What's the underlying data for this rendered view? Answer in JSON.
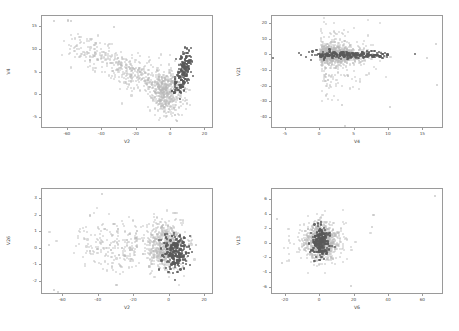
{
  "figure": {
    "title": "",
    "background": "#ffffff",
    "layout": "2x2 scatter plot grid",
    "colors": {
      "majority_class": "#b9b9b9",
      "minority_class": "#595959",
      "axis": "#9a9a9a",
      "text": "#4a4a4a"
    }
  },
  "chart_data": [
    {
      "type": "scatter",
      "panel": "top-left",
      "title": "",
      "xlabel": "V2",
      "ylabel": "V4",
      "xlim": [
        -75,
        25
      ],
      "ylim": [
        -7.5,
        17.5
      ],
      "xticks": [
        "-60",
        "-40",
        "-20",
        "0",
        "20"
      ],
      "xtick_values": [
        -60,
        -40,
        -20,
        0,
        20
      ],
      "yticks": [
        "-5",
        "0",
        "5",
        "10",
        "15"
      ],
      "ytick_values": [
        -5,
        0,
        5,
        10,
        15
      ],
      "grid": false,
      "legend": "none",
      "series": [
        {
          "name": "majority",
          "color": "#b9b9b9",
          "n_points": 900,
          "center": [
            -4,
            2.0
          ],
          "spread": [
            9.0,
            3.2
          ],
          "description": "broad light-gray wedge fanning up-left from origin toward (-50, 11)"
        },
        {
          "name": "minority",
          "color": "#595959",
          "n_points": 170,
          "center": [
            4.5,
            5.0
          ],
          "spread": [
            3.5,
            2.6
          ],
          "description": "dark compact cluster at positive V2, V4 between 0 and 12"
        }
      ]
    },
    {
      "type": "scatter",
      "panel": "top-right",
      "title": "",
      "xlabel": "V4",
      "ylabel": "V21",
      "xlim": [
        -7,
        18
      ],
      "ylim": [
        -47,
        25
      ],
      "xticks": [
        "-5",
        "0",
        "5",
        "10",
        "15"
      ],
      "xtick_values": [
        -5,
        0,
        5,
        10,
        15
      ],
      "yticks": [
        "-40",
        "-30",
        "-20",
        "-10",
        "0",
        "10",
        "20"
      ],
      "ytick_values": [
        -40,
        -30,
        -20,
        -10,
        0,
        10,
        20
      ],
      "grid": false,
      "legend": "none",
      "series": [
        {
          "name": "majority",
          "color": "#b9b9b9",
          "n_points": 950,
          "center": [
            3.0,
            0.0
          ],
          "spread": [
            3.2,
            6.0
          ],
          "description": "light-gray horizontal band centered on V21=0 with scattered outliers down to -45"
        },
        {
          "name": "minority",
          "color": "#595959",
          "n_points": 200,
          "center": [
            5.0,
            0.0
          ],
          "spread": [
            3.6,
            1.4
          ],
          "description": "dark narrow horizontal streak along V21=0 spanning V4 from -1 to 12"
        }
      ]
    },
    {
      "type": "scatter",
      "panel": "bottom-left",
      "title": "",
      "xlabel": "V2",
      "ylabel": "V26",
      "xlim": [
        -72,
        25
      ],
      "ylim": [
        -2.8,
        3.6
      ],
      "xticks": [
        "-60",
        "-40",
        "-20",
        "0",
        "20"
      ],
      "xtick_values": [
        -60,
        -40,
        -20,
        0,
        20
      ],
      "yticks": [
        "-2",
        "-1",
        "0",
        "1",
        "2",
        "3"
      ],
      "ytick_values": [
        -2,
        -1,
        0,
        1,
        2,
        3
      ],
      "grid": false,
      "legend": "none",
      "series": [
        {
          "name": "majority",
          "color": "#b9b9b9",
          "n_points": 900,
          "center": [
            -5.0,
            0.1
          ],
          "spread": [
            9.0,
            0.75
          ],
          "description": "light-gray blob centered near V2=-3, V26=0 with long left tail"
        },
        {
          "name": "minority",
          "color": "#595959",
          "n_points": 200,
          "center": [
            4.0,
            -0.2
          ],
          "spread": [
            4.0,
            0.55
          ],
          "description": "dark cluster at positive V2 around V26 = -0.2"
        }
      ]
    },
    {
      "type": "scatter",
      "panel": "bottom-right",
      "title": "",
      "xlabel": "V6",
      "ylabel": "V13",
      "xlim": [
        -28,
        72
      ],
      "ylim": [
        -7,
        7.5
      ],
      "xticks": [
        "-20",
        "0",
        "20",
        "40",
        "60"
      ],
      "xtick_values": [
        -20,
        0,
        20,
        40,
        60
      ],
      "yticks": [
        "-6",
        "-4",
        "-2",
        "0",
        "2",
        "4",
        "6"
      ],
      "ytick_values": [
        -6,
        -4,
        -2,
        0,
        2,
        4,
        6
      ],
      "grid": false,
      "legend": "none",
      "series": [
        {
          "name": "majority",
          "color": "#b9b9b9",
          "n_points": 900,
          "center": [
            1.0,
            0.3
          ],
          "spread": [
            6.5,
            1.3
          ],
          "description": "light-gray vertical ellipse centered near V6=1, V13=0.3"
        },
        {
          "name": "minority",
          "color": "#595959",
          "n_points": 200,
          "center": [
            0.5,
            0.3
          ],
          "spread": [
            2.6,
            1.2
          ],
          "description": "dark narrow vertical core inside the light cluster"
        }
      ]
    }
  ]
}
